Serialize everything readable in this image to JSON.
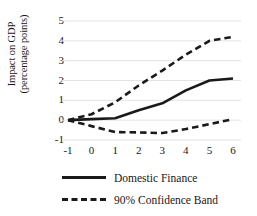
{
  "chart_data": {
    "type": "line",
    "title": "",
    "xlabel": "",
    "ylabel": "Impact on GDP (percentage points)",
    "ylabel_line1": "Impact on GDP",
    "ylabel_line2": "(percentage points)",
    "x": [
      -1,
      0,
      1,
      2,
      3,
      4,
      5,
      6
    ],
    "xlim": [
      -1,
      6
    ],
    "ylim": [
      -1,
      5
    ],
    "xticks": [
      "-1",
      "0",
      "1",
      "2",
      "3",
      "4",
      "5",
      "6"
    ],
    "yticks": [
      "5",
      "4",
      "3",
      "2",
      "1",
      "0",
      "-1"
    ],
    "ytick_values": [
      5,
      4,
      3,
      2,
      1,
      0,
      -1
    ],
    "grid": "horizontal",
    "grid_color": "#e3e3e3",
    "legend_position": "bottom",
    "line_color": "#1a1a1a",
    "series": [
      {
        "name": "Domestic Finance",
        "style": "solid",
        "values": [
          0,
          0.05,
          0.1,
          0.5,
          0.85,
          1.5,
          2.0,
          2.1
        ]
      },
      {
        "name": "90% Confidence Band",
        "style": "dashed",
        "bound": "upper",
        "values": [
          0,
          0.3,
          0.9,
          1.75,
          2.5,
          3.3,
          4.0,
          4.2
        ]
      },
      {
        "name": "90% Confidence Band",
        "style": "dashed",
        "bound": "lower",
        "values": [
          0,
          -0.3,
          -0.6,
          -0.62,
          -0.65,
          -0.45,
          -0.2,
          0.05
        ]
      }
    ]
  },
  "legend": {
    "items": [
      {
        "label": "Domestic Finance",
        "style": "solid"
      },
      {
        "label": "90% Confidence Band",
        "style": "dashed"
      }
    ]
  }
}
